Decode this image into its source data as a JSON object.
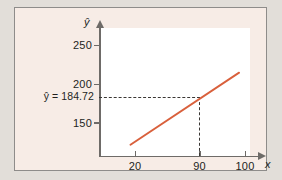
{
  "chart_data": {
    "type": "line",
    "title": "",
    "subtitle": "",
    "xlabel": "x",
    "ylabel": "ŷ",
    "xlim": [
      11,
      104
    ],
    "ylim": [
      118,
      265
    ],
    "grid": false,
    "legend": null,
    "xticks": [
      {
        "value": 20,
        "label": "20"
      },
      {
        "value": 90,
        "label": "90"
      },
      {
        "value": 100,
        "label": "100"
      }
    ],
    "yticks": [
      {
        "value": 250,
        "label": "250"
      },
      {
        "value": 200,
        "label": "200"
      },
      {
        "value": 150,
        "label": "150"
      }
    ],
    "series": [
      {
        "name": "regression-line",
        "color": "#d9603c",
        "x": [
          17,
          96
        ],
        "y": [
          120.8,
          213.8
        ]
      }
    ],
    "annotations": [
      {
        "name": "predicted-value-label",
        "text": "ŷ = 184.72",
        "value": 184.72,
        "at_x": 90
      }
    ],
    "guides": [
      {
        "name": "horizontal-dashed-guide",
        "orientation": "horizontal",
        "value": 184.72
      },
      {
        "name": "vertical-dashed-guide",
        "orientation": "vertical",
        "value": 90
      }
    ],
    "colors": {
      "line": "#d9603c",
      "axis": "#6e6b68",
      "guide": "#3a3734",
      "card_background": "#f7ece6",
      "plot_background": "#ffffff",
      "page_background": "#e2ded9",
      "text": "#231f1d"
    }
  }
}
